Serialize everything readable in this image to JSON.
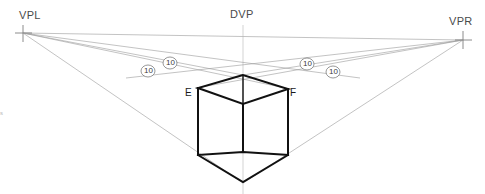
{
  "figure": {
    "type": "two-point-perspective-construction",
    "background_color": "#ffffff",
    "width": 485,
    "height": 194
  },
  "labels": {
    "vpl": "VPL",
    "vpr": "VPR",
    "dvp": "DVP",
    "corner_e": "E",
    "corner_f": "F",
    "edge_fragment": "s"
  },
  "measure_markers": [
    {
      "id": "m1",
      "text": "10",
      "x": 148,
      "y": 71
    },
    {
      "id": "m2",
      "text": "10",
      "x": 170,
      "y": 63
    },
    {
      "id": "m3",
      "text": "10",
      "x": 307,
      "y": 64
    },
    {
      "id": "m4",
      "text": "10",
      "x": 333,
      "y": 72
    }
  ],
  "points": {
    "vpl": {
      "x": 23,
      "y": 33
    },
    "vpr": {
      "x": 463,
      "y": 40
    },
    "dvp": {
      "x": 243,
      "y": 36
    },
    "cube_top_apex": {
      "x": 243,
      "y": 75
    },
    "cube_top_back": {
      "x": 243,
      "y": 91
    },
    "cube_top_left_e": {
      "x": 198,
      "y": 88
    },
    "cube_top_right_f": {
      "x": 288,
      "y": 89
    },
    "cube_bottom_left": {
      "x": 198,
      "y": 155
    },
    "cube_bottom_right": {
      "x": 288,
      "y": 155
    },
    "cube_bottom_back": {
      "x": 243,
      "y": 152
    },
    "cube_bottom_apex": {
      "x": 243,
      "y": 182
    }
  },
  "colors": {
    "construction_line": "#9a9a9a",
    "horizon_line": "#9a9a9a",
    "cube_line": "#111111",
    "label_text": "#4a4a4a",
    "marker_text": "#3c3c3c",
    "background": "#ffffff"
  },
  "geometry_notes": {
    "horizon_label": "horizon line through VPL and VPR",
    "dvp_axis_label": "vertical axis through DVP",
    "cube_label": "cube drawn in two-point perspective"
  }
}
